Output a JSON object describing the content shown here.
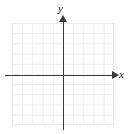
{
  "figure": {
    "name": "blank-cartesian-coordinate-plane",
    "background_color": "#ffffff"
  },
  "axes": {
    "x_label": "x",
    "y_label": "y",
    "axis_color": "#3a3a3a",
    "x_arrow_icon": "arrow-right-icon",
    "y_arrow_icon": "arrow-up-icon"
  },
  "grid": {
    "color": "#ececed",
    "columns": 10,
    "rows": 10,
    "cell_size_px": 10.2
  },
  "chart_data": {
    "type": "scatter",
    "title": "",
    "subtitle": "",
    "xlabel": "x",
    "ylabel": "y",
    "xlim": [
      -5,
      5
    ],
    "ylim": [
      -5,
      5
    ],
    "xticks": [
      -5,
      -4,
      -3,
      -2,
      -1,
      0,
      1,
      2,
      3,
      4,
      5
    ],
    "yticks": [
      -5,
      -4,
      -3,
      -2,
      -1,
      0,
      1,
      2,
      3,
      4,
      5
    ],
    "xtick_labels": [],
    "ytick_labels": [],
    "grid": true,
    "legend": null,
    "annotations": [],
    "series": [
      {
        "name": "",
        "x": [],
        "y": []
      }
    ]
  }
}
